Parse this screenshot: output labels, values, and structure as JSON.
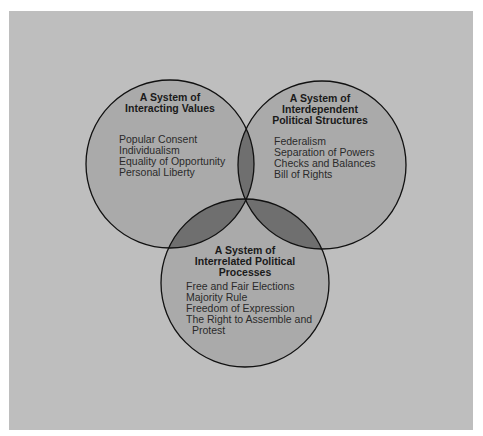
{
  "diagram": {
    "type": "venn",
    "colors": {
      "background": "#bebebe",
      "circle_fill": "#aaaaaa",
      "double_overlap": "#6f6f6f",
      "triple_overlap": "#5e5e5e",
      "stroke": "#111111"
    },
    "circles": [
      {
        "id": "values",
        "title": [
          "A System of",
          "Interacting Values"
        ],
        "items": [
          "Popular Consent",
          "Individualism",
          "Equality of Opportunity",
          "Personal Liberty"
        ]
      },
      {
        "id": "structures",
        "title": [
          "A System of",
          "Interdependent",
          "Political Structures"
        ],
        "items": [
          "Federalism",
          "Separation of Powers",
          "Checks and Balances",
          "Bill of Rights"
        ]
      },
      {
        "id": "processes",
        "title": [
          "A System of",
          "Interrelated Political",
          "Processes"
        ],
        "items": [
          "Free and Fair Elections",
          "Majority Rule",
          "Freedom of Expression",
          "The Right to Assemble and",
          "Protest"
        ]
      }
    ]
  }
}
